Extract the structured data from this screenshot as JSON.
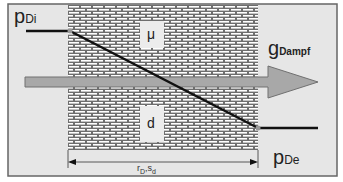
{
  "diagram": {
    "labels": {
      "p_inner": {
        "main": "p",
        "sub": "Di"
      },
      "p_outer": {
        "main": "p",
        "sub": "De"
      },
      "flux": {
        "main": "g",
        "sub": "Dampf"
      },
      "mu": "μ",
      "thickness": "d",
      "dimension": {
        "r": "r",
        "r_sub": "D",
        "sep": ",",
        "s": "s",
        "s_sub": "d"
      }
    },
    "colors": {
      "frame_bg": "#e6e6e6",
      "frame_border": "#666666",
      "brick_mortar": "#ffffff",
      "brick_fill": "#6e6e6e",
      "arrow_fill": "#a8a8a8",
      "arrow_border": "#707070",
      "pressure_line": "#111111"
    }
  }
}
